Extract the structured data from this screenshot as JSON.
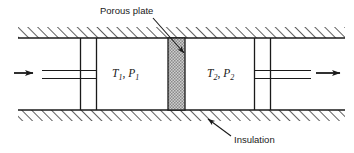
{
  "figure": {
    "type": "engineering-diagram",
    "background_color": "#ffffff",
    "line_color": "#1a1a1a",
    "plate_fill_color": "#b3b3b3"
  },
  "annotations": {
    "porous_plate": {
      "label": "Porous plate",
      "text_x": 100,
      "text_y": 14,
      "leader": {
        "x1": 153,
        "y1": 18,
        "x2": 186,
        "y2": 55
      }
    },
    "insulation": {
      "label": "Insulation",
      "text_x": 234,
      "text_y": 143,
      "leader": {
        "x1": 231,
        "y1": 136,
        "x2": 206,
        "y2": 118
      }
    }
  },
  "chambers": [
    {
      "id": "upstream",
      "temperature_symbol": "T",
      "temperature_subscript": "1",
      "pressure_symbol": "P",
      "pressure_subscript": "1",
      "separator": ",",
      "text_x": 112,
      "text_y": 77
    },
    {
      "id": "downstream",
      "temperature_symbol": "T",
      "temperature_subscript": "2",
      "pressure_symbol": "P",
      "pressure_subscript": "2",
      "separator": ",",
      "text_x": 207,
      "text_y": 77
    }
  ],
  "flow": {
    "inlet_arrow": {
      "x1": 14,
      "y1": 73,
      "x2": 37,
      "y2": 73,
      "direction": "right"
    },
    "outlet_arrow": {
      "x1": 316,
      "y1": 73,
      "x2": 344,
      "y2": 73,
      "direction": "right"
    }
  },
  "geometry": {
    "duct_left": 18,
    "duct_right": 345,
    "wall_top_band": {
      "y_top": 27,
      "y_bottom": 38
    },
    "wall_bottom_band": {
      "y_top": 110,
      "y_bottom": 121
    },
    "porous_plate": {
      "x": 168,
      "y": 38,
      "width": 17,
      "height": 72
    },
    "inner_walls_x": [
      80,
      96,
      254,
      270
    ],
    "pipe_lines_y": [
      70,
      78
    ],
    "inlet_pipe": {
      "x1": 42,
      "x2": 96
    },
    "outlet_pipe": {
      "x1": 254,
      "x2": 311
    }
  }
}
